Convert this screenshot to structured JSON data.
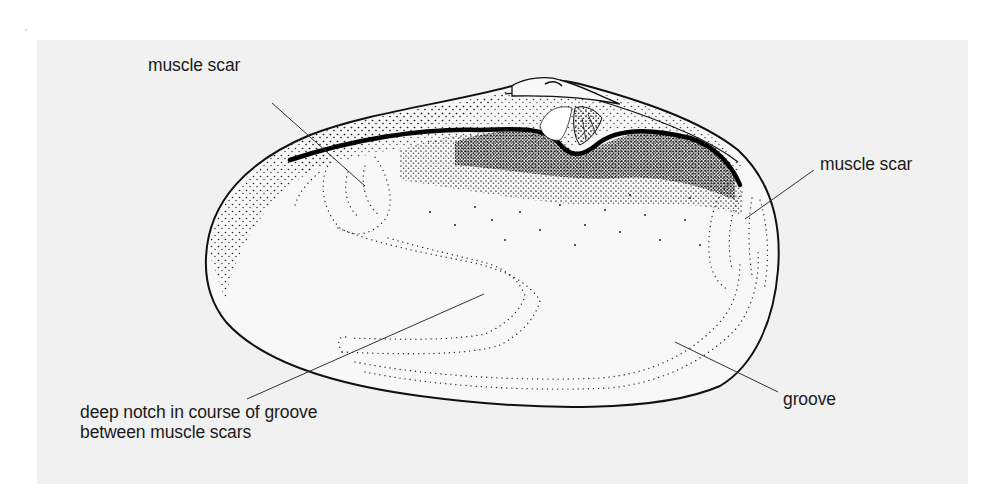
{
  "figure": {
    "background_color": "#f1f1f1",
    "ink_color": "#1a1a1a",
    "labels": {
      "muscle_scar_left": "muscle scar",
      "muscle_scar_right": "muscle scar",
      "notch_line1": "deep notch in course of groove",
      "notch_line2": "between muscle scars",
      "groove": "groove"
    }
  }
}
